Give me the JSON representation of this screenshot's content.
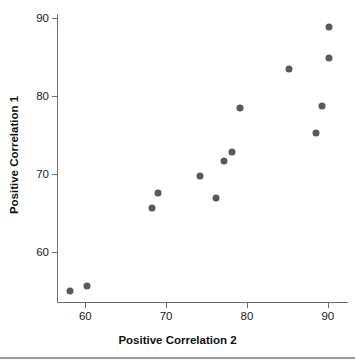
{
  "chart_data": {
    "type": "scatter",
    "title": "",
    "subtitle": "",
    "xlabel": "Positive Correlation 2",
    "ylabel": "Positive Correlation 1",
    "xlim": [
      56.5,
      92.5
    ],
    "ylim": [
      53.5,
      90.5
    ],
    "xticks": [
      60,
      70,
      80,
      90
    ],
    "yticks": [
      60,
      70,
      80,
      90
    ],
    "xtick_labels": [
      "60",
      "70",
      "80",
      "90"
    ],
    "ytick_labels": [
      "60",
      "70",
      "80",
      "90"
    ],
    "grid": false,
    "legend": null,
    "legend_position": "none",
    "marker": {
      "shape": "circle",
      "color": "#595959",
      "size_px": 7
    },
    "series": [
      {
        "name": "observations",
        "points": [
          {
            "x": 58.1,
            "y": 55.1
          },
          {
            "x": 60.2,
            "y": 55.7
          },
          {
            "x": 68.3,
            "y": 65.7
          },
          {
            "x": 69.0,
            "y": 67.6
          },
          {
            "x": 74.2,
            "y": 69.8
          },
          {
            "x": 76.2,
            "y": 67.0
          },
          {
            "x": 77.2,
            "y": 71.7
          },
          {
            "x": 78.2,
            "y": 72.8
          },
          {
            "x": 79.2,
            "y": 78.5
          },
          {
            "x": 85.2,
            "y": 83.4
          },
          {
            "x": 88.5,
            "y": 75.3
          },
          {
            "x": 89.3,
            "y": 78.7
          },
          {
            "x": 90.1,
            "y": 84.9
          },
          {
            "x": 90.1,
            "y": 88.8
          }
        ]
      }
    ]
  }
}
